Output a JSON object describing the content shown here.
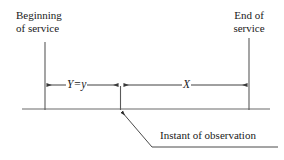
{
  "figure": {
    "background_color": "#ffffff",
    "line_color": "#4d4d4d",
    "text_color": "#1a1a1a"
  },
  "labels": {
    "beginning_of_service": "Beginning\nof service",
    "end_of_service": "End of\nservice",
    "instant_of_observation": "Instant of observation",
    "segment_y": "Y=y",
    "segment_x": "X"
  },
  "geometry": {
    "baseline_y": 109,
    "baseline_x_start": 22,
    "baseline_x_end": 270,
    "left_marker_x": 45,
    "left_marker_y_top": 42,
    "middle_marker_x": 120,
    "middle_marker_y_top": 86,
    "right_marker_x": 249,
    "right_marker_y_top": 38,
    "arrow_row_y": 85,
    "leader_arrow_tip": [
      121,
      111
    ],
    "leader_bend": [
      152,
      147
    ],
    "leader_end": [
      278,
      147
    ]
  }
}
